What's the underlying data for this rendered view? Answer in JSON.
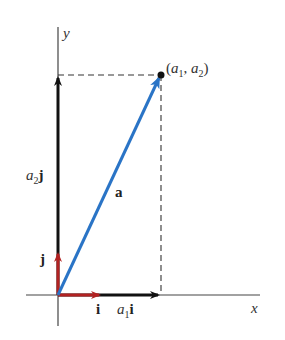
{
  "diagram": {
    "axes": {
      "x_label": "x",
      "y_label": "y"
    },
    "point": {
      "label_open": "(",
      "a1_base": "a",
      "a1_sub": "1",
      "comma": ", ",
      "a2_base": "a",
      "a2_sub": "2",
      "label_close": ")"
    },
    "vectors": {
      "a": {
        "label": "a",
        "color": "#2a74c6"
      },
      "i": {
        "label": "i",
        "color": "#b22222"
      },
      "j": {
        "label": "j",
        "color": "#b22222"
      },
      "a1i": {
        "coef_base": "a",
        "coef_sub": "1",
        "unit": "i",
        "color": "#111111"
      },
      "a2j": {
        "coef_base": "a",
        "coef_sub": "2",
        "unit": "j",
        "color": "#111111"
      }
    },
    "colors": {
      "axis": "#444444",
      "dashed": "#333333",
      "blue": "#2a74c6",
      "red": "#b22222",
      "black": "#111111"
    }
  }
}
